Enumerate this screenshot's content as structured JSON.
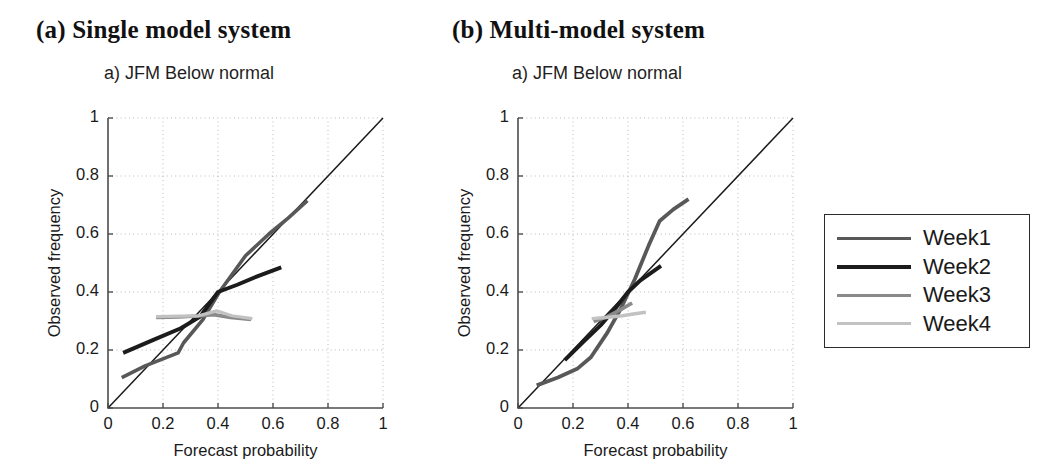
{
  "figure": {
    "panels": [
      {
        "id": "a",
        "title": "(a) Single model system",
        "subtitle": "a) JFM Below normal"
      },
      {
        "id": "b",
        "title": "(b) Multi-model system",
        "subtitle": "a) JFM Below normal"
      }
    ],
    "legend": {
      "entries": [
        {
          "label": "Week1",
          "color": "#585858",
          "width": 3.6
        },
        {
          "label": "Week2",
          "color": "#1c1c1c",
          "width": 4.0
        },
        {
          "label": "Week3",
          "color": "#8a8a8a",
          "width": 3.6
        },
        {
          "label": "Week4",
          "color": "#c2c2c2",
          "width": 3.2
        }
      ]
    }
  },
  "chart_data": [
    {
      "type": "line",
      "panel": "a",
      "title": "a) JFM Below normal",
      "xlabel": "Forecast probability",
      "ylabel": "Observed frequency",
      "xlim": [
        0,
        1
      ],
      "ylim": [
        0,
        1
      ],
      "xticks": [
        0,
        0.2,
        0.4,
        0.6,
        0.8,
        1
      ],
      "yticks": [
        0,
        0.2,
        0.4,
        0.6,
        0.8,
        1
      ],
      "xticklabels": [
        "0",
        "0.2",
        "0.4",
        "0.6",
        "0.8",
        "1"
      ],
      "yticklabels": [
        "0",
        "0.2",
        "0.4",
        "0.6",
        "0.8",
        "1"
      ],
      "grid": true,
      "legend_position": "outside-right",
      "reference_line": {
        "name": "perfect-reliability",
        "from": [
          0,
          0
        ],
        "to": [
          1,
          1
        ],
        "color": "#1a1a1a"
      },
      "series": [
        {
          "name": "Week1",
          "color": "#585858",
          "width": 3.6,
          "x": [
            0.05,
            0.135,
            0.255,
            0.275,
            0.345,
            0.405,
            0.5,
            0.585,
            0.655,
            0.725
          ],
          "y": [
            0.105,
            0.145,
            0.19,
            0.225,
            0.305,
            0.4,
            0.525,
            0.6,
            0.655,
            0.715
          ]
        },
        {
          "name": "Week2",
          "color": "#1c1c1c",
          "width": 4.0,
          "x": [
            0.055,
            0.165,
            0.265,
            0.335,
            0.4,
            0.47,
            0.545,
            0.63
          ],
          "y": [
            0.19,
            0.235,
            0.275,
            0.315,
            0.4,
            0.425,
            0.455,
            0.485
          ]
        },
        {
          "name": "Week3",
          "color": "#8a8a8a",
          "width": 3.6,
          "x": [
            0.175,
            0.255,
            0.325,
            0.385,
            0.445,
            0.52
          ],
          "y": [
            0.312,
            0.314,
            0.317,
            0.322,
            0.312,
            0.305
          ]
        },
        {
          "name": "Week4",
          "color": "#c2c2c2",
          "width": 3.2,
          "x": [
            0.175,
            0.26,
            0.33,
            0.395,
            0.45,
            0.525
          ],
          "y": [
            0.315,
            0.317,
            0.318,
            0.335,
            0.318,
            0.308
          ]
        }
      ]
    },
    {
      "type": "line",
      "panel": "b",
      "title": "a) JFM Below normal",
      "xlabel": "Forecast probability",
      "ylabel": "Observed frequency",
      "xlim": [
        0,
        1
      ],
      "ylim": [
        0,
        1
      ],
      "xticks": [
        0,
        0.2,
        0.4,
        0.6,
        0.8,
        1
      ],
      "yticks": [
        0,
        0.2,
        0.4,
        0.6,
        0.8,
        1
      ],
      "xticklabels": [
        "0",
        "0.2",
        "0.4",
        "0.6",
        "0.8",
        "1"
      ],
      "yticklabels": [
        "0",
        "0.2",
        "0.4",
        "0.6",
        "0.8",
        "1"
      ],
      "grid": true,
      "legend_position": "outside-right",
      "reference_line": {
        "name": "perfect-reliability",
        "from": [
          0,
          0
        ],
        "to": [
          1,
          1
        ],
        "color": "#1a1a1a"
      },
      "series": [
        {
          "name": "Week1",
          "color": "#585858",
          "width": 3.8,
          "x": [
            0.068,
            0.145,
            0.215,
            0.265,
            0.325,
            0.375,
            0.425,
            0.475,
            0.515,
            0.565,
            0.62
          ],
          "y": [
            0.078,
            0.105,
            0.135,
            0.175,
            0.26,
            0.345,
            0.445,
            0.56,
            0.645,
            0.685,
            0.72
          ]
        },
        {
          "name": "Week2",
          "color": "#1c1c1c",
          "width": 4.0,
          "x": [
            0.17,
            0.245,
            0.3,
            0.355,
            0.4,
            0.445,
            0.52
          ],
          "y": [
            0.165,
            0.235,
            0.285,
            0.345,
            0.4,
            0.44,
            0.49
          ]
        },
        {
          "name": "Week3",
          "color": "#8a8a8a",
          "width": 3.6,
          "x": [
            0.275,
            0.325,
            0.375,
            0.415
          ],
          "y": [
            0.298,
            0.315,
            0.34,
            0.362
          ]
        },
        {
          "name": "Week4",
          "color": "#c2c2c2",
          "width": 3.4,
          "x": [
            0.268,
            0.32,
            0.38,
            0.425,
            0.465
          ],
          "y": [
            0.308,
            0.312,
            0.318,
            0.325,
            0.33
          ]
        }
      ]
    }
  ]
}
